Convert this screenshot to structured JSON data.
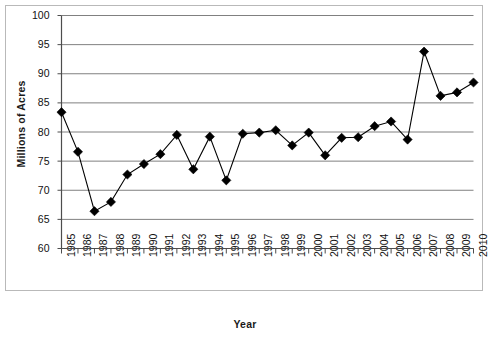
{
  "chart_data": {
    "type": "line",
    "title": "",
    "xlabel": "Year",
    "ylabel": "Millions of Acres",
    "xlim": [
      1985,
      2010
    ],
    "ylim": [
      60,
      100
    ],
    "ytick_step": 5,
    "grid": true,
    "legend": "none",
    "marker": "filled-diamond",
    "marker_color": "#000000",
    "line_color": "#000000",
    "grid_color": "#808080",
    "categories": [
      "1985",
      "1986",
      "1987",
      "1988",
      "1989",
      "1990",
      "1991",
      "1992",
      "1993",
      "1994",
      "1995",
      "1996",
      "1997",
      "1998",
      "1999",
      "2000",
      "2001",
      "2002",
      "2003",
      "2004",
      "2005",
      "2006",
      "2007",
      "2008",
      "2009",
      "2010"
    ],
    "values": [
      83.4,
      76.6,
      66.4,
      68.0,
      72.7,
      74.5,
      76.2,
      79.5,
      73.6,
      79.2,
      71.7,
      79.7,
      79.9,
      80.3,
      77.7,
      79.9,
      76.0,
      79.0,
      79.1,
      81.0,
      81.8,
      78.7,
      93.8,
      86.2,
      86.8,
      88.5
    ],
    "ytick_labels": [
      "100",
      "95",
      "90",
      "85",
      "80",
      "75",
      "70",
      "65",
      "60"
    ],
    "ytick_values": [
      100,
      95,
      90,
      85,
      80,
      75,
      70,
      65,
      60
    ]
  }
}
